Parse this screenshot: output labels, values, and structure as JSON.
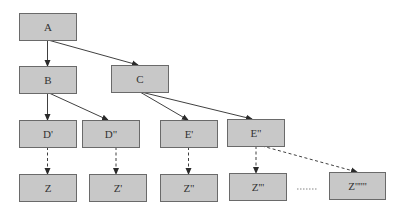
{
  "diagram": {
    "type": "tree",
    "colors": {
      "node_fill": "#c8c8c8",
      "node_border": "#6a6a6a",
      "edge": "#2a2a2a",
      "text": "#333333"
    },
    "nodes": [
      {
        "id": "A",
        "label": "A",
        "x": 19,
        "y": 13,
        "w": 57,
        "h": 27
      },
      {
        "id": "B",
        "label": "B",
        "x": 19,
        "y": 66,
        "w": 57,
        "h": 27
      },
      {
        "id": "C",
        "label": "C",
        "x": 111,
        "y": 65,
        "w": 57,
        "h": 27
      },
      {
        "id": "D1",
        "label": "D'",
        "x": 19,
        "y": 120,
        "w": 57,
        "h": 27
      },
      {
        "id": "D2",
        "label": "D\"",
        "x": 82,
        "y": 120,
        "w": 57,
        "h": 27
      },
      {
        "id": "E1",
        "label": "E'",
        "x": 160,
        "y": 120,
        "w": 57,
        "h": 27
      },
      {
        "id": "E2",
        "label": "E\"",
        "x": 227,
        "y": 119,
        "w": 57,
        "h": 27
      },
      {
        "id": "Z0",
        "label": "Z",
        "x": 19,
        "y": 174,
        "w": 57,
        "h": 27
      },
      {
        "id": "Z1",
        "label": "Z'",
        "x": 89,
        "y": 174,
        "w": 57,
        "h": 27
      },
      {
        "id": "Z2",
        "label": "Z\"",
        "x": 160,
        "y": 174,
        "w": 57,
        "h": 27
      },
      {
        "id": "Z3",
        "label": "Z'''",
        "x": 229,
        "y": 173,
        "w": 57,
        "h": 27
      },
      {
        "id": "Zn",
        "label": "Z''''''",
        "x": 329,
        "y": 172,
        "w": 56,
        "h": 27
      }
    ],
    "edges": [
      {
        "from": "A",
        "to": "B",
        "style": "solid",
        "x1": 47.5,
        "y1": 40,
        "x2": 47.5,
        "y2": 66
      },
      {
        "from": "A",
        "to": "C",
        "style": "solid",
        "x1": 48,
        "y1": 40,
        "x2": 138,
        "y2": 65
      },
      {
        "from": "B",
        "to": "D1",
        "style": "solid",
        "x1": 47.5,
        "y1": 93,
        "x2": 47.5,
        "y2": 120
      },
      {
        "from": "B",
        "to": "D2",
        "style": "solid",
        "x1": 49,
        "y1": 93,
        "x2": 108,
        "y2": 120
      },
      {
        "from": "C",
        "to": "E1",
        "style": "solid",
        "x1": 140,
        "y1": 92,
        "x2": 188,
        "y2": 120
      },
      {
        "from": "C",
        "to": "E2",
        "style": "solid",
        "x1": 141,
        "y1": 92,
        "x2": 252,
        "y2": 119
      },
      {
        "from": "D1",
        "to": "Z0",
        "style": "dashed",
        "x1": 47.5,
        "y1": 147,
        "x2": 47.5,
        "y2": 174
      },
      {
        "from": "D2",
        "to": "Z1",
        "style": "dashed",
        "x1": 116,
        "y1": 147,
        "x2": 116,
        "y2": 174
      },
      {
        "from": "E1",
        "to": "Z2",
        "style": "dashed",
        "x1": 188.5,
        "y1": 147,
        "x2": 188.5,
        "y2": 174
      },
      {
        "from": "E2",
        "to": "Z3",
        "style": "dashed",
        "x1": 256,
        "y1": 146,
        "x2": 256,
        "y2": 173
      },
      {
        "from": "E2",
        "to": "Zn",
        "style": "dashed",
        "x1": 262,
        "y1": 146,
        "x2": 357,
        "y2": 172
      }
    ],
    "ellipsis": {
      "label": "......",
      "x1": 297,
      "x2": 318,
      "y": 189
    }
  }
}
